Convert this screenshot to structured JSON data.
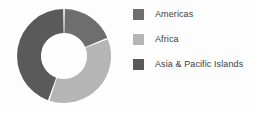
{
  "chart_data": {
    "type": "pie",
    "variant": "donut",
    "title": "",
    "xlabel": "",
    "ylabel": "",
    "legend_position": "right",
    "grid": false,
    "hole_ratio": 0.49,
    "start_angle_deg": 0,
    "direction": "clockwise",
    "categories": [
      "Americas",
      "Africa",
      "Asia & Pacific Islands"
    ],
    "values": [
      19,
      36,
      45
    ],
    "unit": "%",
    "colors": [
      "#6e6e6e",
      "#b5b5b5",
      "#5a5a5a"
    ],
    "slices": [
      {
        "label": "Americas",
        "value": 19,
        "color": "#6e6e6e",
        "start_deg": 0,
        "end_deg": 68
      },
      {
        "label": "Africa",
        "value": 36,
        "color": "#b5b5b5",
        "start_deg": 68,
        "end_deg": 199
      },
      {
        "label": "Asia & Pacific Islands",
        "value": 45,
        "color": "#5a5a5a",
        "start_deg": 199,
        "end_deg": 360
      }
    ]
  },
  "legend": {
    "items": [
      {
        "label": "Americas",
        "color": "#6e6e6e",
        "swatch_name": "legend-swatch-americas"
      },
      {
        "label": "Africa",
        "color": "#b5b5b5",
        "swatch_name": "legend-swatch-africa"
      },
      {
        "label": "Asia & Pacific Islands",
        "color": "#5a5a5a",
        "swatch_name": "legend-swatch-asia-pacific-islands"
      }
    ]
  },
  "style": {
    "background": "#fdfdfd",
    "text_color": "#3c3c3c",
    "separator_color": "#ffffff"
  }
}
